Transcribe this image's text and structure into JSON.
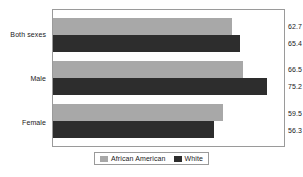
{
  "chart_data": {
    "type": "bar",
    "orientation": "horizontal",
    "title": "",
    "subtitle": "",
    "xlabel": "",
    "ylabel": "",
    "categories": [
      "Both sexes",
      "Male",
      "Female"
    ],
    "series": [
      {
        "name": "African American",
        "color": "#a8a8a8",
        "values": [
          62.7,
          59.5,
          66.5
        ],
        "labels": [
          "62.7",
          "66.5",
          "59.5"
        ]
      },
      {
        "name": "White",
        "color": "#2d2d2d",
        "values": [
          65.4,
          75.2,
          56.3
        ],
        "labels": [
          "65.4",
          "75.2",
          "56.3"
        ]
      }
    ],
    "groups": [
      {
        "category": "Both sexes",
        "bars": [
          {
            "series": "African American",
            "value": 62.7,
            "label": "62.7"
          },
          {
            "series": "White",
            "value": 65.4,
            "label": "65.4"
          }
        ]
      },
      {
        "category": "Male",
        "bars": [
          {
            "series": "African American",
            "value": 66.5,
            "label": "66.5"
          },
          {
            "series": "White",
            "value": 75.2,
            "label": "75.2"
          }
        ]
      },
      {
        "category": "Female",
        "bars": [
          {
            "series": "African American",
            "value": 59.5,
            "label": "59.5"
          },
          {
            "series": "White",
            "value": 56.3,
            "label": "56.3"
          }
        ]
      }
    ],
    "xlim": [
      0,
      81
    ],
    "grid": false,
    "axis_ticks_visible": false,
    "legend_position": "bottom",
    "plot_border_color": "#9a9a9a"
  },
  "legend": {
    "items": [
      {
        "label": "African American",
        "color": "#a8a8a8"
      },
      {
        "label": "White",
        "color": "#2d2d2d"
      }
    ]
  }
}
